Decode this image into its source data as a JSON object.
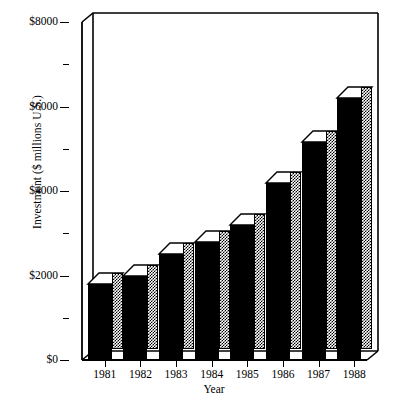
{
  "chart_data": {
    "type": "bar",
    "title": "",
    "subtitle": "",
    "xlabel": "Year",
    "ylabel": "Investment ($ millions U.S.)",
    "categories": [
      "1981",
      "1982",
      "1983",
      "1984",
      "1985",
      "1986",
      "1987",
      "1988"
    ],
    "values": [
      1800,
      2000,
      2500,
      2800,
      3200,
      4200,
      5150,
      6200
    ],
    "series": [
      {
        "name": "Investment",
        "values": [
          1800,
          2000,
          2500,
          2800,
          3200,
          4200,
          5150,
          6200
        ]
      }
    ],
    "ylim": [
      0,
      8000
    ],
    "y_major_ticks": [
      0,
      2000,
      4000,
      6000,
      8000
    ],
    "y_minor_ticks": [
      1000,
      3000,
      5000,
      7000
    ],
    "y_tick_labels": [
      "$0",
      "$2000",
      "$4000",
      "$6000",
      "$8000"
    ],
    "grid": false,
    "legend": null,
    "legend_position": "none",
    "style": "3d-bars",
    "colors": {
      "bar_front": "#000000",
      "bar_top": "#ffffff",
      "bar_side": "#808080",
      "axis": "#000000",
      "background": "#ffffff"
    }
  },
  "axes": {
    "y_title": "Investment ($ millions U.S.)",
    "x_title": "Year"
  }
}
